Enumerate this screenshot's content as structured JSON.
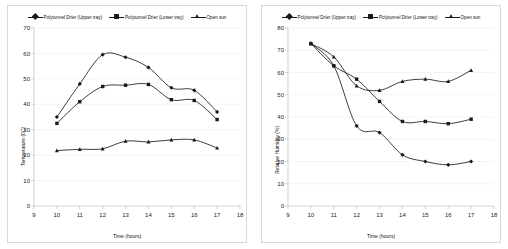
{
  "figure": {
    "panel_count": 2
  },
  "panels": [
    {
      "id": "temperature-panel",
      "legend": [
        {
          "label": "Polytunnel Drier (Upper tray)",
          "marker": "diamond-icon"
        },
        {
          "label": "Polytunnel Drier (Lower tray)",
          "marker": "square-icon"
        },
        {
          "label": "Open sun",
          "marker": "triangle-icon"
        }
      ],
      "chart_data": {
        "type": "line",
        "title": "",
        "xlabel": "Time (hours)",
        "ylabel": "Temperature (0C)",
        "x": [
          10,
          11,
          12,
          13,
          14,
          15,
          16,
          17
        ],
        "xlim": [
          9,
          18
        ],
        "ylim": [
          0,
          70
        ],
        "xticks": [
          9,
          10,
          11,
          12,
          13,
          14,
          15,
          16,
          17,
          18
        ],
        "yticks": [
          0,
          10,
          20,
          30,
          40,
          50,
          60,
          70
        ],
        "grid": true,
        "legend_position": "top",
        "series": [
          {
            "name": "Polytunnel Drier (Upper tray)",
            "marker": "diamond",
            "values": [
              35.0,
              48.0,
              59.5,
              58.5,
              54.5,
              46.5,
              45.5,
              37.0
            ]
          },
          {
            "name": "Polytunnel Drier (Lower tray)",
            "marker": "square",
            "values": [
              32.5,
              41.0,
              47.0,
              47.5,
              47.8,
              41.8,
              41.5,
              34.0
            ]
          },
          {
            "name": "Open sun",
            "marker": "triangle",
            "values": [
              21.8,
              22.3,
              22.5,
              25.5,
              25.2,
              26.0,
              26.0,
              22.8
            ]
          }
        ]
      }
    },
    {
      "id": "humidity-panel",
      "legend": [
        {
          "label": "Polytunnel Drier (Upper tray)",
          "marker": "diamond-icon"
        },
        {
          "label": "Polytunnel Drier (Lower tray)",
          "marker": "square-icon"
        },
        {
          "label": "Open sun",
          "marker": "triangle-icon"
        }
      ],
      "chart_data": {
        "type": "line",
        "title": "",
        "xlabel": "Time (hours)",
        "ylabel": "Relative Humidity (%)",
        "x": [
          10,
          11,
          12,
          13,
          14,
          15,
          16,
          17
        ],
        "xlim": [
          9,
          18
        ],
        "ylim": [
          0,
          80
        ],
        "xticks": [
          9,
          10,
          11,
          12,
          13,
          14,
          15,
          16,
          17,
          18
        ],
        "yticks": [
          0,
          10,
          20,
          30,
          40,
          50,
          60,
          70,
          80
        ],
        "grid": true,
        "legend_position": "top",
        "series": [
          {
            "name": "Polytunnel Drier (Upper tray)",
            "marker": "diamond",
            "values": [
              73.0,
              63.0,
              36.0,
              33.0,
              23.0,
              20.0,
              18.5,
              20.0
            ]
          },
          {
            "name": "Polytunnel Drier (Lower tray)",
            "marker": "square",
            "values": [
              73.0,
              63.0,
              57.0,
              47.0,
              38.0,
              38.0,
              37.0,
              39.0
            ]
          },
          {
            "name": "Open sun",
            "marker": "triangle",
            "values": [
              73.0,
              67.0,
              54.0,
              52.0,
              56.0,
              57.0,
              56.0,
              61.0
            ]
          }
        ]
      }
    }
  ],
  "colors": {
    "line": "#1a1a1a",
    "grid": "#eeeeee",
    "axis": "#bfbfbf",
    "panel_border": "#d9d9d9",
    "background": "#ffffff"
  }
}
